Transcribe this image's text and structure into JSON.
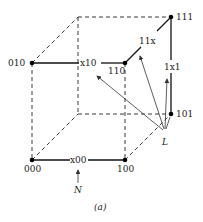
{
  "figure": {
    "caption": "(a)",
    "vertices": [
      {
        "label": "000",
        "x": 32,
        "y": 160,
        "filled": true
      },
      {
        "label": "100",
        "x": 125,
        "y": 160,
        "filled": true
      },
      {
        "label": "010",
        "x": 32,
        "y": 63,
        "filled": true
      },
      {
        "label": "110",
        "x": 125,
        "y": 63,
        "filled": true
      },
      {
        "label": "111",
        "x": 171,
        "y": 17,
        "filled": true
      },
      {
        "label": "101",
        "x": 171,
        "y": 114,
        "filled": true
      }
    ],
    "edge_labels": {
      "x00": "x00",
      "x10": "x10",
      "11x": "11x",
      "1x1": "1x1"
    },
    "markers": {
      "L": "L",
      "N": "N"
    }
  }
}
